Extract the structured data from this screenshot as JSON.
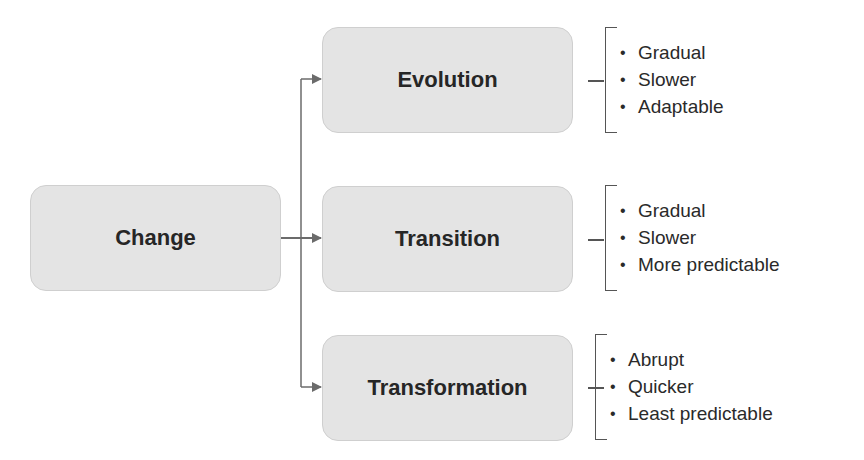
{
  "root": {
    "label": "Change"
  },
  "branches": [
    {
      "label": "Evolution",
      "traits": [
        "Gradual",
        "Slower",
        "Adaptable"
      ]
    },
    {
      "label": "Transition",
      "traits": [
        "Gradual",
        "Slower",
        "More predictable"
      ]
    },
    {
      "label": "Transformation",
      "traits": [
        "Abrupt",
        "Quicker",
        "Least predictable"
      ]
    }
  ],
  "colors": {
    "box_fill": "#e4e4e4",
    "box_border": "#cfcfcf",
    "connector": "#6b6b6b",
    "text": "#262626"
  }
}
